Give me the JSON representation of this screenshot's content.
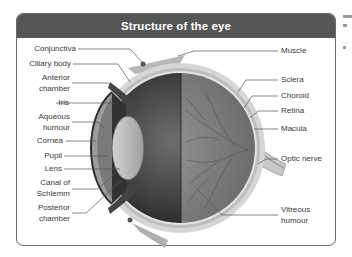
{
  "diagram": {
    "title": "Structure of the eye",
    "colors": {
      "header_bg": "#555555",
      "header_text": "#ffffff",
      "frame_border": "#6a6a6a",
      "label_text": "#3a3a3a",
      "leader_line": "#555555"
    },
    "left_labels": [
      {
        "id": "conjunctiva",
        "text": "Conjunctiva"
      },
      {
        "id": "ciliary-body",
        "text": "Ciliary body"
      },
      {
        "id": "anterior-chamber",
        "line1": "Anterior",
        "line2": "chamber"
      },
      {
        "id": "iris",
        "text": "Iris"
      },
      {
        "id": "aqueous-humour",
        "line1": "Aqueous",
        "line2": "humour"
      },
      {
        "id": "cornea",
        "text": "Cornea"
      },
      {
        "id": "pupil",
        "text": "Pupil"
      },
      {
        "id": "lens",
        "text": "Lens"
      },
      {
        "id": "canal-of-schlemm",
        "line1": "Canal of",
        "line2": "Schlemm"
      },
      {
        "id": "posterior-chamber",
        "line1": "Posterior",
        "line2": "chamber"
      }
    ],
    "right_labels": [
      {
        "id": "muscle",
        "text": "Muscle"
      },
      {
        "id": "sclera",
        "text": "Sclera"
      },
      {
        "id": "choroid",
        "text": "Choroid"
      },
      {
        "id": "retina",
        "text": "Retina"
      },
      {
        "id": "macula",
        "text": "Macula"
      },
      {
        "id": "optic-nerve",
        "text": "Optic nerve"
      },
      {
        "id": "vitreous-humour",
        "line1": "Vitreous",
        "line2": "humour"
      }
    ]
  }
}
